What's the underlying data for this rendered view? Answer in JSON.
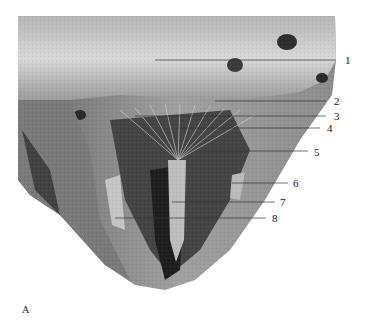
{
  "figure": {
    "panel_label": "A",
    "labels": [
      {
        "number": "1",
        "x": 345,
        "y": 62,
        "line_from": [
          155,
          60
        ],
        "line_to": [
          336,
          60
        ]
      },
      {
        "number": "2",
        "x": 334,
        "y": 101,
        "line_from": [
          215,
          101
        ],
        "line_to": [
          326,
          101
        ]
      },
      {
        "number": "3",
        "x": 334,
        "y": 115,
        "line_from": [
          135,
          116
        ],
        "line_to": [
          326,
          116
        ]
      },
      {
        "number": "4",
        "x": 327,
        "y": 128,
        "line_from": [
          180,
          128
        ],
        "line_to": [
          320,
          128
        ]
      },
      {
        "number": "5",
        "x": 314,
        "y": 152,
        "line_from": [
          200,
          151
        ],
        "line_to": [
          308,
          151
        ]
      },
      {
        "number": "6",
        "x": 293,
        "y": 183,
        "line_from": [
          232,
          183
        ],
        "line_to": [
          288,
          183
        ]
      },
      {
        "number": "7",
        "x": 280,
        "y": 201,
        "line_from": [
          172,
          202
        ],
        "line_to": [
          275,
          202
        ]
      },
      {
        "number": "8",
        "x": 272,
        "y": 217,
        "line_from": [
          115,
          218
        ],
        "line_to": [
          266,
          218
        ]
      }
    ]
  },
  "colors": {
    "background": "#ffffff",
    "tissue_light": "#c8c8c8",
    "tissue_mid": "#8a8a8a",
    "tissue_dark": "#2a2a2a",
    "label_text": "#111111",
    "leader_line": "#333333"
  }
}
